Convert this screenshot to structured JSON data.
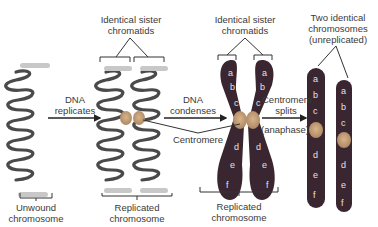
{
  "diagram": {
    "labels": {
      "sister_chromatids_1": [
        "Identical sister",
        "chromatids"
      ],
      "sister_chromatids_2": [
        "Identical sister",
        "chromatids"
      ],
      "two_identical": [
        "Two identical",
        "chromosomes",
        "(unreplicated)"
      ],
      "dna_replicates": [
        "DNA",
        "replicates"
      ],
      "dna_condenses": [
        "DNA",
        "condenses"
      ],
      "centromere": "Centromere",
      "centromere_splits": [
        "Centromere",
        "splits"
      ],
      "anaphase": "(anaphase)",
      "unwound": [
        "Unwound",
        "chromosome"
      ],
      "replicated_1": [
        "Replicated",
        "chromosome"
      ],
      "replicated_2": [
        "Replicated",
        "chromosome"
      ]
    },
    "gene_loci": [
      "a",
      "b",
      "c",
      "d",
      "e",
      "f"
    ],
    "colors": {
      "dna_strand": "#4a4a4a",
      "chromosome_body": "#3a2630",
      "centromere": "#c9a27a",
      "locus_band": "#8a7a86",
      "label_text": "#3a3a3a",
      "line": "#333333"
    }
  }
}
